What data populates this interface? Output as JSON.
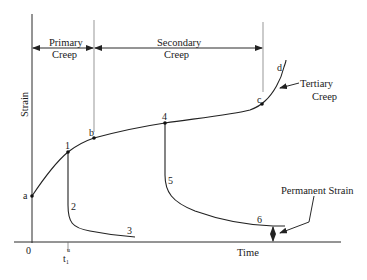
{
  "diagram": {
    "axes": {
      "y_label": "Strain",
      "x_label": "Time",
      "origin_label": "0",
      "tick_label": "t₁",
      "tick_label_sup": "u"
    },
    "regions": {
      "primary": {
        "line1": "Primary",
        "line2": "Creep"
      },
      "secondary": {
        "line1": "Secondary",
        "line2": "Creep"
      },
      "tertiary": {
        "line1": "Tertiary",
        "line2": "Creep"
      }
    },
    "points": {
      "a": "a",
      "b": "b",
      "c": "c",
      "d": "d",
      "p1": "1",
      "p2": "2",
      "p3": "3",
      "p4": "4",
      "p5": "5",
      "p6": "6"
    },
    "annotations": {
      "permanent_strain": "Permanent Strain"
    },
    "colors": {
      "line": "#222222",
      "background": "#ffffff"
    }
  }
}
